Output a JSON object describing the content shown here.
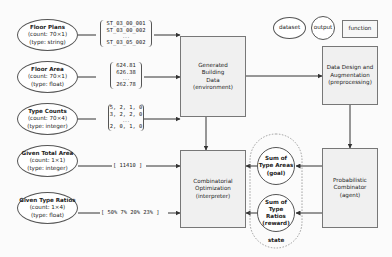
{
  "legend": {
    "dataset": "dataset",
    "output": "output",
    "function": "function"
  },
  "datasets": [
    {
      "title": "Floor Plans",
      "count": "(count: 70×1)",
      "type": "(type: string)"
    },
    {
      "title": "Floor Area",
      "count": "(count: 70×1)",
      "type": "(type: float)"
    },
    {
      "title": "Type Counts",
      "count": "(count: 70×4)",
      "type": "(type: integer)"
    },
    {
      "title": "Given Total Area",
      "count": "(count: 1×1)",
      "type": "(type: integer)"
    },
    {
      "title": "Given Type Ratios",
      "count": "(count: 1×4)",
      "type": "(type: float)"
    }
  ],
  "lists": {
    "floor_plans": [
      "ST_03_00_001",
      "ST_03_00_002",
      "...",
      "ST_03_05_002"
    ],
    "floor_area": [
      "624.81",
      "626.38",
      "...",
      "262.78"
    ],
    "type_counts": [
      "5, 2, 1, 0",
      "3, 2, 2, 0",
      "...",
      "2, 0, 1, 0"
    ],
    "total_area": "[ 11410 ]",
    "type_ratios": "[ 50%  7%  20%  23% ]"
  },
  "functions": {
    "generated": [
      "Generated",
      "Building",
      "Data",
      "(environment)"
    ],
    "combinatorial": [
      "Combinatorial",
      "Optimization",
      "(interpreter)"
    ],
    "data_design": [
      "Data Design and",
      "Augmentation",
      "(preprocessing)"
    ],
    "probabilistic": [
      "Probabilistic",
      "Combinator",
      "(agent)"
    ]
  },
  "outputs": {
    "goal": [
      "Sum of",
      "Type Areas",
      "(goal)"
    ],
    "reward": [
      "Sum of",
      "Type Ratios",
      "(reward)"
    ]
  },
  "state_label": "state"
}
